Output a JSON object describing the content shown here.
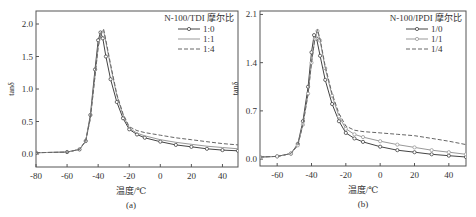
{
  "chart_data": [
    {
      "type": "line",
      "panel_label": "(a)",
      "xlabel": "温度/℃",
      "ylabel": "tanδ",
      "xlim": [
        -80,
        50
      ],
      "ylim": [
        -0.2,
        2.2
      ],
      "xticks": [
        -80,
        -60,
        -40,
        -20,
        0,
        20,
        40
      ],
      "yticks": [
        0.0,
        0.5,
        1.0,
        1.5,
        2.0
      ],
      "ytick_labels": [
        "0.0",
        "0.5",
        "1.0",
        "1.5",
        "2.0"
      ],
      "grid": false,
      "legend_title": "N-100/TDI 摩尔比",
      "legend_position": "upper right",
      "series": [
        {
          "name": "1:0",
          "style": "solid-circle",
          "color": "#444444",
          "x": [
            -80,
            -60,
            -52,
            -48,
            -45,
            -42,
            -40,
            -38.5,
            -37,
            -35,
            -32,
            -28,
            -24,
            -20,
            -15,
            -10,
            0,
            10,
            20,
            30,
            40,
            50
          ],
          "y": [
            0.02,
            0.03,
            0.07,
            0.2,
            0.6,
            1.3,
            1.75,
            1.87,
            1.78,
            1.5,
            1.15,
            0.8,
            0.55,
            0.38,
            0.3,
            0.25,
            0.19,
            0.14,
            0.11,
            0.08,
            0.06,
            0.05
          ]
        },
        {
          "name": "1:1",
          "style": "solid-light",
          "color": "#999999",
          "x": [
            -80,
            -60,
            -52,
            -48,
            -45,
            -42,
            -40,
            -38,
            -36.5,
            -35,
            -32,
            -28,
            -24,
            -20,
            -15,
            -10,
            0,
            10,
            20,
            30,
            40,
            50
          ],
          "y": [
            0.02,
            0.03,
            0.07,
            0.2,
            0.55,
            1.2,
            1.65,
            1.88,
            1.9,
            1.72,
            1.35,
            0.9,
            0.6,
            0.4,
            0.32,
            0.28,
            0.22,
            0.18,
            0.15,
            0.12,
            0.1,
            0.08
          ]
        },
        {
          "name": "1:4",
          "style": "dashed",
          "color": "#666666",
          "x": [
            -80,
            -60,
            -52,
            -48,
            -45,
            -42,
            -40,
            -38,
            -36.5,
            -35,
            -32,
            -28,
            -24,
            -20,
            -15,
            -10,
            0,
            10,
            20,
            30,
            40,
            50
          ],
          "y": [
            0.02,
            0.03,
            0.07,
            0.2,
            0.55,
            1.2,
            1.65,
            1.88,
            1.92,
            1.75,
            1.38,
            0.92,
            0.62,
            0.42,
            0.36,
            0.33,
            0.29,
            0.25,
            0.22,
            0.19,
            0.16,
            0.14
          ]
        }
      ]
    },
    {
      "type": "line",
      "panel_label": "(b)",
      "xlabel": "温度/℃",
      "ylabel": "tanδ",
      "xlim": [
        -70,
        50
      ],
      "ylim": [
        -0.1,
        2.15
      ],
      "xticks": [
        -60,
        -40,
        -20,
        0,
        20,
        40
      ],
      "yticks": [
        0.0,
        0.7,
        1.4,
        2.1
      ],
      "ytick_labels": [
        "0.0",
        "0.7",
        "1.4",
        "2.1"
      ],
      "grid": false,
      "legend_title": "N-100/IPDI 摩尔比",
      "legend_position": "upper right",
      "series": [
        {
          "name": "1/0",
          "style": "solid-circle",
          "color": "#444444",
          "x": [
            -70,
            -60,
            -52,
            -48,
            -45,
            -42,
            -40,
            -38.5,
            -37,
            -35,
            -32,
            -28,
            -24,
            -20,
            -15,
            -10,
            0,
            10,
            20,
            30,
            40,
            50
          ],
          "y": [
            0.03,
            0.04,
            0.08,
            0.22,
            0.55,
            1.05,
            1.55,
            1.8,
            1.75,
            1.5,
            1.15,
            0.8,
            0.55,
            0.38,
            0.3,
            0.25,
            0.18,
            0.13,
            0.1,
            0.07,
            0.05,
            0.03
          ]
        },
        {
          "name": "1/1",
          "style": "solid-light-circle",
          "color": "#999999",
          "x": [
            -70,
            -60,
            -52,
            -48,
            -45,
            -42,
            -40,
            -38,
            -36.5,
            -35,
            -32,
            -28,
            -24,
            -20,
            -15,
            -10,
            0,
            10,
            20,
            30,
            40,
            50
          ],
          "y": [
            0.03,
            0.04,
            0.08,
            0.2,
            0.5,
            0.95,
            1.4,
            1.75,
            1.86,
            1.72,
            1.32,
            0.92,
            0.62,
            0.44,
            0.36,
            0.32,
            0.26,
            0.21,
            0.17,
            0.13,
            0.1,
            0.07
          ]
        },
        {
          "name": "1/4",
          "style": "dashed",
          "color": "#666666",
          "x": [
            -70,
            -60,
            -52,
            -48,
            -45,
            -42,
            -40,
            -38,
            -36.5,
            -35,
            -32,
            -28,
            -24,
            -20,
            -15,
            -10,
            0,
            10,
            20,
            30,
            40,
            50
          ],
          "y": [
            0.03,
            0.04,
            0.08,
            0.2,
            0.5,
            0.95,
            1.4,
            1.75,
            1.88,
            1.74,
            1.35,
            0.95,
            0.66,
            0.48,
            0.42,
            0.4,
            0.38,
            0.36,
            0.34,
            0.3,
            0.26,
            0.21
          ]
        }
      ]
    }
  ],
  "layout": {
    "panels": [
      {
        "left": 36,
        "top": 11,
        "right": 238,
        "bottom": 167
      },
      {
        "left": 260,
        "top": 11,
        "right": 466,
        "bottom": 166
      }
    ]
  }
}
